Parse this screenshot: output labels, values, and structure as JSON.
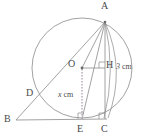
{
  "figure": {
    "stroke_color": "#8a8a8a",
    "label_color": "#4a4a4a",
    "dotted_color": "#b9a9b9",
    "background": "#ffffff"
  },
  "points": {
    "A": {
      "label": "A",
      "x": 105,
      "y": 22,
      "label_x": 101,
      "label_y": 2
    },
    "B": {
      "label": "B",
      "x": 16,
      "y": 120,
      "label_x": 5,
      "label_y": 115
    },
    "C": {
      "label": "C",
      "x": 105,
      "y": 119,
      "label_x": 101,
      "label_y": 124
    },
    "D": {
      "label": "D",
      "x": 38,
      "y": 96,
      "label_x": 27,
      "label_y": 88
    },
    "E": {
      "label": "E",
      "x": 82,
      "y": 119,
      "label_x": 78,
      "label_y": 124
    },
    "H": {
      "label": "H",
      "x": 105,
      "y": 68,
      "label_x": 107,
      "label_y": 61
    },
    "O": {
      "label": "O",
      "x": 82,
      "y": 68,
      "label_x": 69,
      "label_y": 60
    }
  },
  "circle": {
    "center_x": 82,
    "center_y": 68,
    "radius": 50
  },
  "measurements": [
    {
      "name": "segment-hc",
      "variable": "3",
      "unit": "cm",
      "x": 116,
      "y": 63
    },
    {
      "name": "segment-oe",
      "variable": "x",
      "unit": "cm",
      "x": 59,
      "y": 92
    }
  ],
  "right_angles": [
    {
      "name": "right-angle-h",
      "x": 105,
      "y": 68
    },
    {
      "name": "right-angle-e",
      "x": 82,
      "y": 119
    },
    {
      "name": "right-angle-c",
      "x": 105,
      "y": 119
    }
  ]
}
